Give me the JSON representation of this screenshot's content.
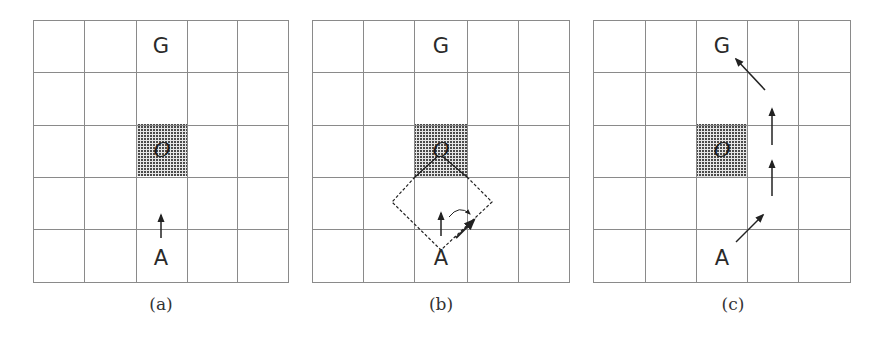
{
  "figure": {
    "grid": {
      "rows": 5,
      "cols": 5,
      "line_color": "#8a8a8a",
      "obstacle_color": "#4a4a4a"
    },
    "panels": [
      {
        "id": "a",
        "caption": "(a)",
        "goal_label": "G",
        "agent_label": "A",
        "obstacle_label": "O",
        "description": "Agent A below obstacle O, heading straight up toward goal G"
      },
      {
        "id": "b",
        "caption": "(b)",
        "goal_label": "G",
        "agent_label": "A",
        "obstacle_label": "O",
        "description": "Dashed diamond collision cone from A to obstacle; heading rotates from up to up-right"
      },
      {
        "id": "c",
        "caption": "(c)",
        "goal_label": "G",
        "agent_label": "A",
        "obstacle_label": "O",
        "description": "Resulting path: A moves up-right, passes obstacle on the right going up, then up-left to G"
      }
    ]
  }
}
